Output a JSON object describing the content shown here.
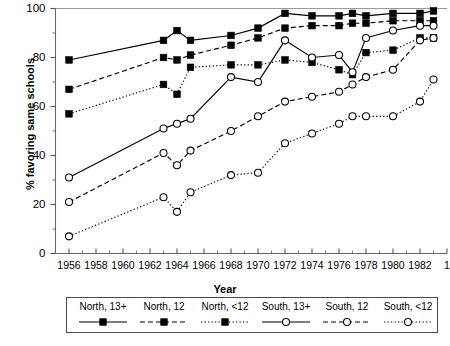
{
  "chart_data": {
    "type": "line",
    "title": "",
    "xlabel": "Year",
    "ylabel": "% favoring same schools",
    "xlim": [
      1955,
      1984
    ],
    "ylim": [
      0,
      100
    ],
    "yticks": [
      0,
      20,
      40,
      60,
      80,
      100
    ],
    "xticks": [
      1956,
      1958,
      1960,
      1962,
      1964,
      1966,
      1968,
      1970,
      1972,
      1974,
      1976,
      1978,
      1980,
      1982,
      1984
    ],
    "xtick_labels": [
      "1956",
      "1958",
      "1960",
      "1962",
      "1964",
      "1966",
      "1968",
      "1970",
      "1972",
      "1974",
      "1976",
      "1978",
      "1980",
      "1982",
      "1"
    ],
    "grid": false,
    "legend_position": "below",
    "series": [
      {
        "name": "North, 13+",
        "marker": "filled-square",
        "linestyle": "solid",
        "color": "#000000",
        "points": [
          [
            1956,
            79
          ],
          [
            1963,
            87
          ],
          [
            1964,
            91
          ],
          [
            1965,
            87
          ],
          [
            1968,
            89
          ],
          [
            1970,
            92
          ],
          [
            1972,
            98
          ],
          [
            1974,
            97
          ],
          [
            1976,
            97
          ],
          [
            1977,
            98
          ],
          [
            1978,
            97
          ],
          [
            1980,
            98
          ],
          [
            1982,
            98
          ],
          [
            1983,
            99
          ]
        ]
      },
      {
        "name": "North, 12",
        "marker": "filled-square",
        "linestyle": "dashed",
        "color": "#000000",
        "points": [
          [
            1956,
            67
          ],
          [
            1963,
            80
          ],
          [
            1964,
            79
          ],
          [
            1965,
            81
          ],
          [
            1968,
            85
          ],
          [
            1970,
            88
          ],
          [
            1972,
            92
          ],
          [
            1974,
            93
          ],
          [
            1976,
            93
          ],
          [
            1977,
            94
          ],
          [
            1978,
            94
          ],
          [
            1980,
            95
          ],
          [
            1982,
            95
          ],
          [
            1983,
            95
          ]
        ]
      },
      {
        "name": "North, <12",
        "marker": "filled-square",
        "linestyle": "dotted",
        "color": "#000000",
        "points": [
          [
            1956,
            57
          ],
          [
            1963,
            69
          ],
          [
            1964,
            65
          ],
          [
            1965,
            76
          ],
          [
            1968,
            77
          ],
          [
            1970,
            77
          ],
          [
            1972,
            79
          ],
          [
            1974,
            78
          ],
          [
            1976,
            75
          ],
          [
            1977,
            73
          ],
          [
            1978,
            82
          ],
          [
            1980,
            83
          ],
          [
            1982,
            88
          ],
          [
            1983,
            88
          ]
        ]
      },
      {
        "name": "South, 13+",
        "marker": "open-circle",
        "linestyle": "solid",
        "color": "#000000",
        "points": [
          [
            1956,
            31
          ],
          [
            1963,
            51
          ],
          [
            1964,
            53
          ],
          [
            1965,
            55
          ],
          [
            1968,
            72
          ],
          [
            1970,
            70
          ],
          [
            1972,
            87
          ],
          [
            1974,
            80
          ],
          [
            1976,
            81
          ],
          [
            1977,
            74
          ],
          [
            1978,
            88
          ],
          [
            1980,
            91
          ],
          [
            1982,
            93
          ],
          [
            1983,
            93
          ]
        ]
      },
      {
        "name": "South, 12",
        "marker": "open-circle",
        "linestyle": "dashed",
        "color": "#000000",
        "points": [
          [
            1956,
            21
          ],
          [
            1963,
            41
          ],
          [
            1964,
            36
          ],
          [
            1965,
            42
          ],
          [
            1968,
            50
          ],
          [
            1970,
            56
          ],
          [
            1972,
            62
          ],
          [
            1974,
            64
          ],
          [
            1976,
            66
          ],
          [
            1977,
            69
          ],
          [
            1978,
            72
          ],
          [
            1980,
            75
          ],
          [
            1982,
            87
          ],
          [
            1983,
            88
          ]
        ]
      },
      {
        "name": "South, <12",
        "marker": "open-circle",
        "linestyle": "dotted",
        "color": "#000000",
        "points": [
          [
            1956,
            7
          ],
          [
            1963,
            23
          ],
          [
            1964,
            17
          ],
          [
            1965,
            25
          ],
          [
            1968,
            32
          ],
          [
            1970,
            33
          ],
          [
            1972,
            45
          ],
          [
            1974,
            49
          ],
          [
            1976,
            53
          ],
          [
            1977,
            56
          ],
          [
            1978,
            56
          ],
          [
            1980,
            56
          ],
          [
            1982,
            62
          ],
          [
            1983,
            71
          ]
        ]
      }
    ]
  },
  "legend": {
    "items": [
      {
        "label": "North, 13+",
        "marker": "filled-square",
        "linestyle": "solid"
      },
      {
        "label": "North, 12",
        "marker": "filled-square",
        "linestyle": "dashed"
      },
      {
        "label": "North, <12",
        "marker": "filled-square",
        "linestyle": "dotted"
      },
      {
        "label": "South, 13+",
        "marker": "open-circle",
        "linestyle": "solid"
      },
      {
        "label": "South, 12",
        "marker": "open-circle",
        "linestyle": "dashed"
      },
      {
        "label": "South, <12",
        "marker": "open-circle",
        "linestyle": "dotted"
      }
    ]
  }
}
